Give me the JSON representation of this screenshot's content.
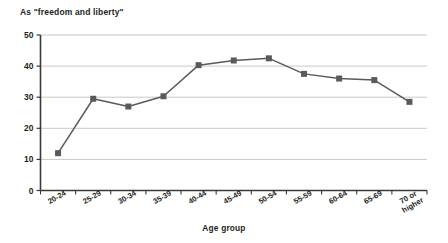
{
  "chart_data": {
    "type": "line",
    "title": "As \"freedom and liberty\"",
    "xlabel": "Age group",
    "ylabel": "",
    "categories": [
      "20-24",
      "25-29",
      "30-34",
      "35-39",
      "40-44",
      "45-49",
      "50-54",
      "55-59",
      "60-64",
      "65-69",
      "70 or higher"
    ],
    "values": [
      12,
      29.5,
      27,
      30.3,
      40.3,
      41.8,
      42.5,
      37.5,
      36,
      35.5,
      28.5
    ],
    "ylim": [
      0,
      50
    ],
    "yticks": [
      0,
      10,
      20,
      30,
      40,
      50
    ],
    "ytick_labels": [
      "0",
      "10",
      "20",
      "30",
      "40",
      "50"
    ],
    "grid": true,
    "legend": false,
    "colors": {
      "line": "#5a5a5a",
      "marker": "#5a5a5a",
      "grid": "#c9c9c9",
      "axis": "#3a3a3a",
      "text": "#231f20",
      "background": "#ffffff"
    },
    "marker": "square"
  }
}
